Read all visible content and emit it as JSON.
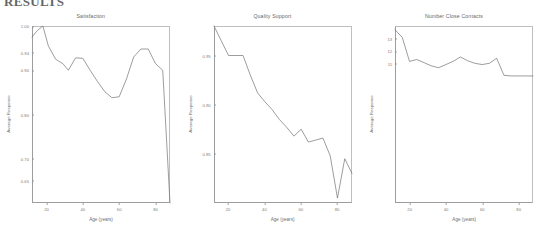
{
  "document": {
    "heading": "RESULTS"
  },
  "chart_data": [
    {
      "type": "line",
      "title": "Satisfaction",
      "xlabel": "Age (years)",
      "ylabel": "Average Response",
      "xlim": [
        12,
        88
      ],
      "ylim": [
        0.6,
        1.0
      ],
      "xticks": [
        "20",
        "40",
        "60",
        "80"
      ],
      "yticks": [
        "1.00",
        "0.94",
        "0.90",
        "0.80",
        "0.70",
        "0.65"
      ],
      "grid": false,
      "legend": "none",
      "x": [
        12,
        15,
        18,
        21,
        25,
        29,
        32,
        36,
        40,
        44,
        48,
        52,
        56,
        60,
        64,
        68,
        72,
        76,
        80,
        84,
        88
      ],
      "y": [
        0.975,
        0.99,
        1.0,
        0.955,
        0.925,
        0.915,
        0.9,
        0.928,
        0.927,
        0.9,
        0.875,
        0.852,
        0.838,
        0.84,
        0.88,
        0.93,
        0.948,
        0.948,
        0.915,
        0.9,
        0.6
      ]
    },
    {
      "type": "line",
      "title": "Quality Support",
      "xlabel": "Age (years)",
      "ylabel": "Average Response",
      "xlim": [
        12,
        88
      ],
      "ylim": [
        0.8,
        0.98
      ],
      "xticks": [
        "20",
        "40",
        "60",
        "80"
      ],
      "yticks": [
        "0.95",
        "0.90",
        "0.85"
      ],
      "grid": false,
      "legend": "none",
      "x": [
        12,
        16,
        20,
        24,
        28,
        32,
        36,
        40,
        44,
        48,
        52,
        56,
        60,
        64,
        68,
        72,
        76,
        80,
        84,
        88
      ],
      "y": [
        0.98,
        0.965,
        0.95,
        0.95,
        0.95,
        0.93,
        0.912,
        0.903,
        0.895,
        0.885,
        0.877,
        0.868,
        0.875,
        0.862,
        0.864,
        0.866,
        0.848,
        0.805,
        0.845,
        0.83
      ]
    },
    {
      "type": "line",
      "title": "Number Close Contacts",
      "xlabel": "Age (years)",
      "ylabel": "Average Response",
      "xlim": [
        12,
        88
      ],
      "ylim": [
        0,
        14
      ],
      "xticks": [
        "20",
        "40",
        "60",
        "80"
      ],
      "yticks": [
        "13",
        "12",
        "11"
      ],
      "grid": false,
      "legend": "none",
      "x": [
        12,
        16,
        20,
        24,
        28,
        32,
        36,
        40,
        44,
        48,
        52,
        56,
        60,
        64,
        68,
        72,
        76,
        80,
        84,
        88
      ],
      "y": [
        13.7,
        13.1,
        11.2,
        11.35,
        11.1,
        10.85,
        10.7,
        10.95,
        11.2,
        11.55,
        11.25,
        11.05,
        10.95,
        11.05,
        11.45,
        10.1,
        10.05,
        10.05,
        10.05,
        10.05
      ]
    }
  ]
}
